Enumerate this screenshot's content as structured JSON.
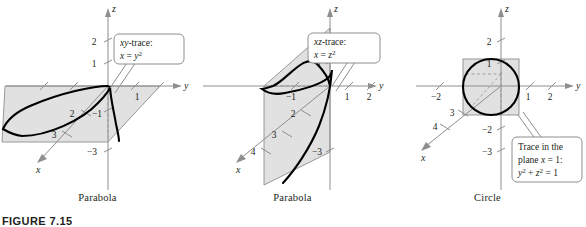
{
  "figure": {
    "label": "FIGURE 7.15",
    "background": "#ffffff",
    "plane_fill": "#dcdcdc",
    "axis_color": "#8e8e90",
    "curve_color": "#000000"
  },
  "panels": [
    {
      "id": "panel-1",
      "caption": "Parabola",
      "callout": {
        "line1_prefix": "xy",
        "line1_suffix": "-trace:",
        "line2_var": "x",
        "line2_eq": " = ",
        "line2_rhs_base": "y",
        "line2_rhs_exp": "2"
      },
      "axis_names": {
        "x": "x",
        "y": "y",
        "z": "z"
      },
      "z_ticks": [
        "2",
        "1",
        "−3"
      ],
      "y_ticks": [
        "1"
      ],
      "x_ticks": [
        "2",
        "3"
      ],
      "neg_tick": "−1"
    },
    {
      "id": "panel-2",
      "caption": "Parabola",
      "callout": {
        "line1_prefix": "xz",
        "line1_suffix": "-trace:",
        "line2_var": "x",
        "line2_eq": " = ",
        "line2_rhs_base": "z",
        "line2_rhs_exp": "2"
      },
      "axis_names": {
        "x": "x",
        "y": "y",
        "z": "z"
      },
      "z_ticks": [
        "1",
        "−3"
      ],
      "y_ticks": [
        "1",
        "2"
      ],
      "x_ticks": [
        "2",
        "3",
        "4"
      ],
      "neg_tick": "−1"
    },
    {
      "id": "panel-3",
      "caption": "Circle",
      "callout": {
        "line1": "Trace in the",
        "line2_a": "plane ",
        "line2_var": "x",
        "line2_b": " = 1:",
        "line3_y": "y",
        "line3_yexp": "2",
        "line3_plus": " + ",
        "line3_z": "z",
        "line3_zexp": "2",
        "line3_eq": " = 1"
      },
      "axis_names": {
        "x": "x",
        "y": "y",
        "z": "z"
      },
      "z_ticks": [
        "2",
        "1",
        "−2",
        "−3"
      ],
      "y_ticks": [
        "−2",
        "1",
        "2"
      ],
      "x_ticks": [
        "3",
        "4"
      ]
    }
  ]
}
